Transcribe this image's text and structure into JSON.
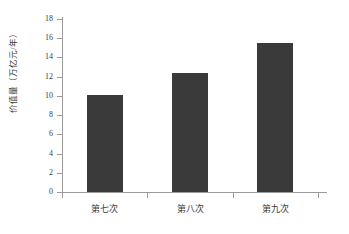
{
  "chart_data": {
    "type": "bar",
    "title": "",
    "subtitle": "",
    "xlabel": "",
    "ylabel": "价值量（万亿元/年）",
    "categories": [
      "第七次",
      "第八次",
      "第九次"
    ],
    "values": [
      10.1,
      12.4,
      15.5
    ],
    "series": [
      {
        "name": "价值量",
        "values": [
          10.1,
          12.4,
          15.5
        ]
      }
    ],
    "ylim": [
      0,
      18
    ],
    "ytick_step": 2,
    "ytick_labels": [
      "0",
      "2",
      "4",
      "6",
      "8",
      "10",
      "12",
      "14",
      "16",
      "18"
    ],
    "grid": false,
    "legend": false,
    "legend_position": "none",
    "bar_color": "#3a3a3a",
    "axis_color": "#9a9a9a",
    "background_color": "#ffffff",
    "annotations": []
  }
}
